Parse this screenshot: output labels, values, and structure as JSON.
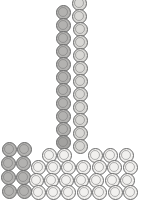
{
  "scene": {
    "title": "L-shaped disc packing",
    "width": 142,
    "height": 209,
    "background": "#ffffff",
    "disc_diameter": 15,
    "stroke_color": "#6b6b6b"
  },
  "palette": {
    "light": "#f1f0ee",
    "medium": "#d8d7d4",
    "dark": "#b3b2b0",
    "darker": "#a3a2a0"
  },
  "groups": [
    {
      "name": "vertical-column-left",
      "shade": "dark",
      "count": 12
    },
    {
      "name": "vertical-column-right",
      "shade": "medium",
      "count": 12
    },
    {
      "name": "base-left-dark-cluster",
      "shade": "dark",
      "count": 10
    },
    {
      "name": "base-light-field",
      "shade": "light",
      "count": 27
    }
  ],
  "discs": [
    {
      "id": "vr-00",
      "cx": 79,
      "cy": 3,
      "r": 7.5,
      "shade": "medium"
    },
    {
      "id": "vl-00",
      "cx": 63,
      "cy": 12,
      "r": 7.5,
      "shade": "dark"
    },
    {
      "id": "vr-01",
      "cx": 79,
      "cy": 16,
      "r": 7.5,
      "shade": "medium"
    },
    {
      "id": "vl-01",
      "cx": 63,
      "cy": 25,
      "r": 7.5,
      "shade": "dark"
    },
    {
      "id": "vr-02",
      "cx": 80,
      "cy": 29,
      "r": 7.5,
      "shade": "medium"
    },
    {
      "id": "vl-02",
      "cx": 63,
      "cy": 38,
      "r": 7.5,
      "shade": "dark"
    },
    {
      "id": "vr-03",
      "cx": 80,
      "cy": 42,
      "r": 7.5,
      "shade": "medium"
    },
    {
      "id": "vl-03",
      "cx": 63,
      "cy": 51,
      "r": 7.5,
      "shade": "dark"
    },
    {
      "id": "vr-04",
      "cx": 80,
      "cy": 55,
      "r": 7.5,
      "shade": "medium"
    },
    {
      "id": "vl-04",
      "cx": 63,
      "cy": 64,
      "r": 7.5,
      "shade": "dark"
    },
    {
      "id": "vr-05",
      "cx": 80,
      "cy": 68,
      "r": 7.5,
      "shade": "medium"
    },
    {
      "id": "vl-05",
      "cx": 63,
      "cy": 77,
      "r": 7.5,
      "shade": "dark"
    },
    {
      "id": "vr-06",
      "cx": 80,
      "cy": 81,
      "r": 7.5,
      "shade": "medium"
    },
    {
      "id": "vl-06",
      "cx": 63,
      "cy": 90,
      "r": 7.5,
      "shade": "dark"
    },
    {
      "id": "vr-07",
      "cx": 80,
      "cy": 94,
      "r": 7.5,
      "shade": "medium"
    },
    {
      "id": "vl-07",
      "cx": 63,
      "cy": 103,
      "r": 7.5,
      "shade": "dark"
    },
    {
      "id": "vr-08",
      "cx": 80,
      "cy": 107,
      "r": 7.5,
      "shade": "medium"
    },
    {
      "id": "vl-08",
      "cx": 63,
      "cy": 116,
      "r": 7.5,
      "shade": "dark"
    },
    {
      "id": "vr-09",
      "cx": 80,
      "cy": 120,
      "r": 7.5,
      "shade": "medium"
    },
    {
      "id": "vl-09",
      "cx": 63,
      "cy": 129,
      "r": 7.5,
      "shade": "dark"
    },
    {
      "id": "vr-10",
      "cx": 80,
      "cy": 133,
      "r": 7.5,
      "shade": "medium"
    },
    {
      "id": "vl-10",
      "cx": 63,
      "cy": 142,
      "r": 7.5,
      "shade": "darker"
    },
    {
      "id": "vr-11",
      "cx": 80,
      "cy": 146,
      "r": 7.5,
      "shade": "medium"
    },
    {
      "id": "bl-r0c0",
      "cx": 9,
      "cy": 149,
      "r": 7.5,
      "shade": "dark"
    },
    {
      "id": "bl-r0c1",
      "cx": 24,
      "cy": 149,
      "r": 7.5,
      "shade": "dark"
    },
    {
      "id": "bl-r1c0",
      "cx": 8,
      "cy": 163,
      "r": 7.5,
      "shade": "dark"
    },
    {
      "id": "bl-r1c1",
      "cx": 23,
      "cy": 163,
      "r": 7.5,
      "shade": "dark"
    },
    {
      "id": "bl-r2c0",
      "cx": 8,
      "cy": 177,
      "r": 7.5,
      "shade": "dark"
    },
    {
      "id": "bl-r2c1",
      "cx": 23,
      "cy": 177,
      "r": 7.5,
      "shade": "dark"
    },
    {
      "id": "bl-r3c0",
      "cx": 9,
      "cy": 191,
      "r": 7.5,
      "shade": "dark"
    },
    {
      "id": "bl-r3c1",
      "cx": 24,
      "cy": 191,
      "r": 7.5,
      "shade": "dark"
    },
    {
      "id": "bf-r0c2",
      "cx": 49,
      "cy": 155,
      "r": 7.5,
      "shade": "light"
    },
    {
      "id": "bf-r0c3",
      "cx": 64,
      "cy": 155,
      "r": 7.5,
      "shade": "light"
    },
    {
      "id": "bf-r0c5",
      "cx": 95,
      "cy": 155,
      "r": 7.5,
      "shade": "light"
    },
    {
      "id": "bf-r0c6",
      "cx": 110,
      "cy": 155,
      "r": 7.5,
      "shade": "light"
    },
    {
      "id": "bf-r0c7",
      "cx": 126,
      "cy": 155,
      "r": 7.5,
      "shade": "light"
    },
    {
      "id": "bf-r1c1",
      "cx": 38,
      "cy": 167,
      "r": 7.5,
      "shade": "light"
    },
    {
      "id": "bf-r1c2",
      "cx": 53,
      "cy": 167,
      "r": 7.5,
      "shade": "light"
    },
    {
      "id": "bf-r1c3",
      "cx": 68,
      "cy": 167,
      "r": 7.5,
      "shade": "light"
    },
    {
      "id": "bf-r1c4",
      "cx": 83,
      "cy": 167,
      "r": 7.5,
      "shade": "light"
    },
    {
      "id": "bf-r1c5",
      "cx": 99,
      "cy": 167,
      "r": 7.5,
      "shade": "light"
    },
    {
      "id": "bf-r1c6",
      "cx": 114,
      "cy": 167,
      "r": 7.5,
      "shade": "light"
    },
    {
      "id": "bf-r1c7",
      "cx": 130,
      "cy": 167,
      "r": 7.5,
      "shade": "light"
    },
    {
      "id": "bf-r2c1",
      "cx": 36,
      "cy": 180,
      "r": 7.5,
      "shade": "light"
    },
    {
      "id": "bf-r2c2",
      "cx": 51,
      "cy": 180,
      "r": 7.5,
      "shade": "light"
    },
    {
      "id": "bf-r2c3",
      "cx": 66,
      "cy": 180,
      "r": 7.5,
      "shade": "light"
    },
    {
      "id": "bf-r2c4",
      "cx": 81,
      "cy": 180,
      "r": 7.5,
      "shade": "light"
    },
    {
      "id": "bf-r2c5",
      "cx": 96,
      "cy": 180,
      "r": 7.5,
      "shade": "light"
    },
    {
      "id": "bf-r2c6",
      "cx": 112,
      "cy": 180,
      "r": 7.5,
      "shade": "light"
    },
    {
      "id": "bf-r2c7",
      "cx": 127,
      "cy": 180,
      "r": 7.5,
      "shade": "light"
    },
    {
      "id": "bf-r3c1",
      "cx": 38,
      "cy": 192,
      "r": 7.5,
      "shade": "light"
    },
    {
      "id": "bf-r3c2",
      "cx": 53,
      "cy": 192,
      "r": 7.5,
      "shade": "light"
    },
    {
      "id": "bf-r3c3",
      "cx": 68,
      "cy": 192,
      "r": 7.5,
      "shade": "light"
    },
    {
      "id": "bf-r3c4",
      "cx": 84,
      "cy": 192,
      "r": 7.5,
      "shade": "light"
    },
    {
      "id": "bf-r3c5",
      "cx": 99,
      "cy": 192,
      "r": 7.5,
      "shade": "light"
    },
    {
      "id": "bf-r3c6",
      "cx": 115,
      "cy": 192,
      "r": 7.5,
      "shade": "light"
    },
    {
      "id": "bf-r3c7",
      "cx": 130,
      "cy": 192,
      "r": 7.5,
      "shade": "light"
    }
  ]
}
